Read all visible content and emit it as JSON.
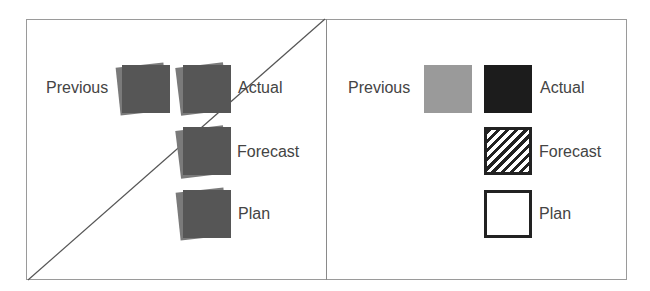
{
  "left_panel": {
    "description": "Before: all squares similar dark gray, crossed out",
    "labels": {
      "previous": "Previous",
      "actual": "Actual",
      "forecast": "Forecast",
      "plan": "Plan"
    },
    "square_color": "#565656",
    "shadow_color": "#7a7a7a"
  },
  "right_panel": {
    "description": "After: distinct visual encodings per scenario",
    "labels": {
      "previous": "Previous",
      "actual": "Actual",
      "forecast": "Forecast",
      "plan": "Plan"
    },
    "encodings": {
      "previous": "solid light gray #9a9a9a",
      "actual": "solid black #1c1c1c",
      "forecast": "diagonal hatched",
      "plan": "white with outline"
    }
  }
}
